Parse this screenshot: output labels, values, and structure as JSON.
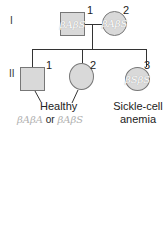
{
  "generations": {
    "I": "I",
    "II": "II"
  },
  "gen1": {
    "father": {
      "number": "1",
      "genotype": "βAβS"
    },
    "mother": {
      "number": "2",
      "genotype": "βAβS"
    }
  },
  "gen2": {
    "child1": {
      "number": "1"
    },
    "child2": {
      "number": "2"
    },
    "child3": {
      "number": "3",
      "genotype": "βSβS"
    }
  },
  "labels": {
    "healthy": "Healthy",
    "healthy_genotype_a": "βAβA",
    "or": "or",
    "healthy_genotype_b": "βAβS",
    "sickle": "Sickle-cell",
    "anemia": "anemia"
  }
}
